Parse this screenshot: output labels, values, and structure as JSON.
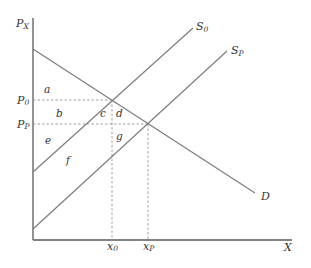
{
  "diagram": {
    "type": "supply-demand",
    "axes": {
      "y_label": "P",
      "y_label_sub": "X",
      "x_label": "X"
    },
    "curves": {
      "s0": {
        "label": "S",
        "sub": "0"
      },
      "sp": {
        "label": "S",
        "sub": "P"
      },
      "d": {
        "label": "D"
      }
    },
    "price_ticks": [
      {
        "label": "P",
        "sub": "0"
      },
      {
        "label": "P",
        "sub": "P"
      }
    ],
    "quantity_ticks": [
      {
        "label": "x",
        "sub": "0"
      },
      {
        "label": "x",
        "sub": "P"
      }
    ],
    "areas": [
      "a",
      "b",
      "c",
      "d",
      "e",
      "f",
      "g"
    ],
    "colors": {
      "axis": "#5a5a5a",
      "curve": "#7d7d7d",
      "text": "#333333",
      "background": "#ffffff"
    }
  }
}
